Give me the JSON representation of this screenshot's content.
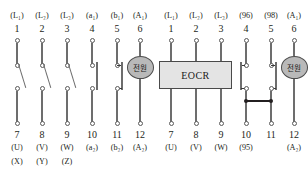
{
  "figure": {
    "type": "electrical-terminal-wiring-diagram",
    "panels": [
      {
        "id": "magnetic-contactor",
        "device_label": "",
        "top_labels": [
          "(L₁)",
          "(L₂)",
          "(L₃)",
          "(a₁)",
          "(b₁)",
          "(A₁)"
        ],
        "top_numbers": [
          "1",
          "2",
          "3",
          "4",
          "5",
          "6"
        ],
        "bottom_numbers": [
          "7",
          "8",
          "9",
          "10",
          "11",
          "12"
        ],
        "bottom_labels": [
          "(U)",
          "(V)",
          "(W)",
          "(a₂)",
          "(b₂)",
          "(A₂)"
        ],
        "bottom_labels2": [
          "(X)",
          "(Y)",
          "(Z)",
          "",
          "",
          ""
        ],
        "coil_label": "전원",
        "poles": [
          {
            "terminal": "1-7",
            "kind": "switch-blade"
          },
          {
            "terminal": "2-8",
            "kind": "switch-blade"
          },
          {
            "terminal": "3-9",
            "kind": "switch-blade"
          },
          {
            "terminal": "4-10",
            "kind": "normally-open"
          },
          {
            "terminal": "5-11",
            "kind": "normally-closed"
          },
          {
            "terminal": "6-12",
            "kind": "coil"
          }
        ]
      },
      {
        "id": "eocr",
        "device_label": "EOCR",
        "top_labels": [
          "(L₁)",
          "(L₂)",
          "(L₃)",
          "(96)",
          "(98)",
          "(A₁)"
        ],
        "top_numbers": [
          "1",
          "2",
          "3",
          "4",
          "5",
          "6"
        ],
        "bottom_numbers": [
          "7",
          "8",
          "9",
          "10",
          "11",
          "12"
        ],
        "bottom_labels": [
          "(U)",
          "(V)",
          "(W)",
          "(95)",
          "",
          "(A₂)"
        ],
        "bottom_labels2": [
          "",
          "",
          "",
          "",
          "",
          ""
        ],
        "coil_label": "전원",
        "poles": [
          {
            "terminal": "1-7",
            "kind": "through-box"
          },
          {
            "terminal": "2-8",
            "kind": "through-box"
          },
          {
            "terminal": "3-9",
            "kind": "through-box"
          },
          {
            "terminal": "4-10",
            "kind": "normally-closed-96-95"
          },
          {
            "terminal": "5-11",
            "kind": "normally-open-98"
          },
          {
            "terminal": "6-12",
            "kind": "coil"
          }
        ],
        "jumper": {
          "from": "10",
          "to": "11",
          "style": "solid-bar-with-junction-dots"
        }
      }
    ],
    "colors": {
      "wire": "#6d6d6d",
      "terminal_stroke": "#5a5a5a",
      "coil_fill": "#b9b9b9",
      "box_fill": "#e4e4e4",
      "box_stroke": "#4a4a4a",
      "text": "#231f20",
      "background": "#ffffff"
    }
  }
}
